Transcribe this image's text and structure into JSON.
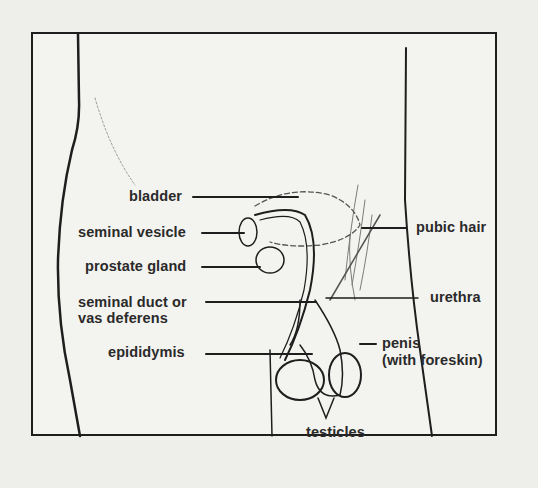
{
  "diagram": {
    "type": "anatomical-illustration",
    "labels": {
      "bladder": "bladder",
      "seminal_vesicle": "seminal vesicle",
      "prostate_gland": "prostate gland",
      "seminal_duct_line1": "seminal duct or",
      "seminal_duct_line2": "vas deferens",
      "epididymis": "epididymis",
      "pubic_hair": "pubic hair",
      "urethra": "urethra",
      "penis_line1": "penis",
      "penis_line2": "(with foreskin)",
      "testicles": "testicles"
    },
    "colors": {
      "ink": "#1e1e1e",
      "paper": "#eeeeea"
    }
  }
}
